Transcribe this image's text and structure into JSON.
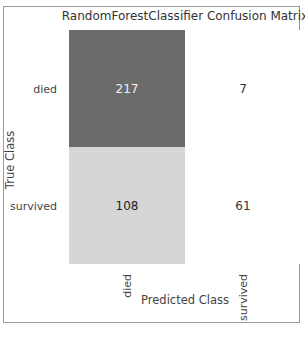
{
  "chart_data": {
    "type": "heatmap",
    "title": "RandomForestClassifier Confusion Matrix",
    "xlabel": "Predicted Class",
    "ylabel": "True Class",
    "x_categories": [
      "died",
      "survived"
    ],
    "y_categories": [
      "died",
      "survived"
    ],
    "values": [
      [
        217,
        7
      ],
      [
        108,
        61
      ]
    ],
    "cell_colors": [
      [
        "#6b6b6b",
        "#ffffff"
      ],
      [
        "#d6d6d6",
        "#ffffff"
      ]
    ],
    "text_colors": [
      [
        "#f2f2f2",
        "#333333"
      ],
      [
        "#222222",
        "#333333"
      ]
    ],
    "grid": false,
    "legend": "none"
  },
  "caption": "Figure 1 – (partially cut off, illegible)"
}
